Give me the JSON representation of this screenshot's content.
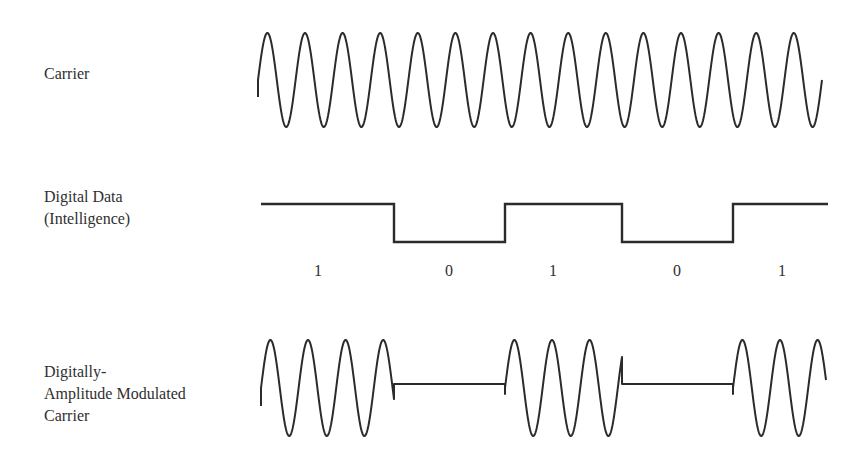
{
  "rows": {
    "carrier": {
      "label_lines": [
        "Carrier"
      ]
    },
    "digital_data": {
      "label_lines": [
        "Digital Data",
        "(Intelligence)"
      ]
    },
    "modulated": {
      "label_lines": [
        "Digitally-",
        "Amplitude Modulated",
        "Carrier"
      ]
    }
  },
  "bits": [
    {
      "value": "1",
      "x": 318
    },
    {
      "value": "0",
      "x": 449
    },
    {
      "value": "1",
      "x": 553
    },
    {
      "value": "0",
      "x": 677
    },
    {
      "value": "1",
      "x": 782
    }
  ],
  "geometry": {
    "x_start": 258,
    "x_end": 826,
    "period": 37.6,
    "transitions": [
      394,
      505,
      622,
      733
    ],
    "carrier": {
      "center": 80,
      "amplitude": 47
    },
    "data": {
      "high": 204,
      "low": 242
    },
    "modulated": {
      "center": 388,
      "amplitude": 48
    }
  },
  "colors": {
    "stroke": "#2b2b2b",
    "text": "#2f2f2f",
    "background": "#ffffff"
  }
}
